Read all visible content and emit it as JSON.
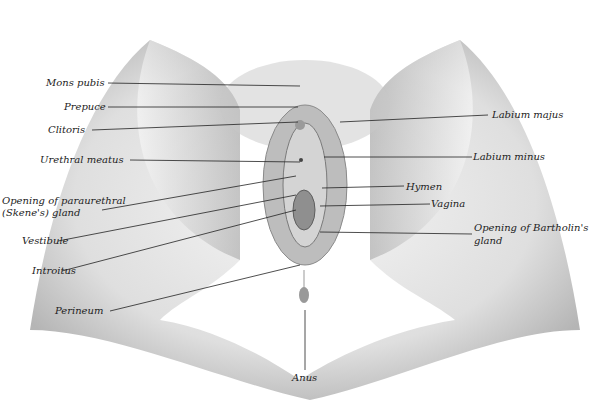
{
  "figure": {
    "type": "anatomical-illustration",
    "style": "stylized schematic"
  },
  "labels_left": [
    {
      "id": "mons-pubis",
      "text": "Mons pubis"
    },
    {
      "id": "prepuce",
      "text": "Prepuce"
    },
    {
      "id": "clitoris",
      "text": "Clitoris"
    },
    {
      "id": "urethral-meatus",
      "text": "Urethral meatus"
    },
    {
      "id": "paraurethral-gland-1",
      "text": "Opening of paraurethral"
    },
    {
      "id": "paraurethral-gland-2",
      "text": "(Skene's) gland"
    },
    {
      "id": "vestibule",
      "text": "Vestibule"
    },
    {
      "id": "introitus",
      "text": "Introitus"
    },
    {
      "id": "perineum",
      "text": "Perineum"
    }
  ],
  "labels_right": [
    {
      "id": "labium-majus",
      "text": "Labium majus"
    },
    {
      "id": "labium-minus",
      "text": "Labium minus"
    },
    {
      "id": "hymen",
      "text": "Hymen"
    },
    {
      "id": "vagina",
      "text": "Vagina"
    },
    {
      "id": "bartholin-1",
      "text": "Opening of Bartholin's"
    },
    {
      "id": "bartholin-2",
      "text": "gland"
    }
  ],
  "labels_bottom": [
    {
      "id": "anus",
      "text": "Anus"
    }
  ]
}
